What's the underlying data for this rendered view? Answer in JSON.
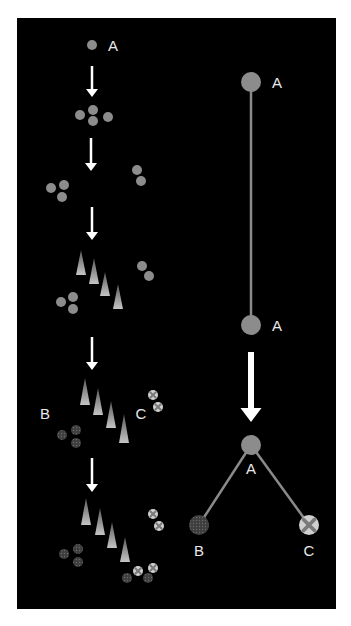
{
  "colors": {
    "background": "#000000",
    "page": "#ffffff",
    "cell_A": "#8c8c8c",
    "cell_B": "#4a4a4a",
    "cell_C": "#d0d0d0",
    "arrow": "#ffffff",
    "tree_line": "#8a8a8a",
    "label": "#e8e8e8"
  },
  "left_panel": {
    "title": "cell lineage over time",
    "labels": [
      {
        "id": "A-top",
        "text": "A",
        "x": 113,
        "y": 45
      },
      {
        "id": "B",
        "text": "B",
        "x": 45,
        "y": 413
      },
      {
        "id": "C",
        "text": "C",
        "x": 141,
        "y": 413
      }
    ],
    "arrows": [
      {
        "x": 92,
        "y1": 66,
        "y2": 97
      },
      {
        "x": 91,
        "y1": 138,
        "y2": 171
      },
      {
        "x": 92,
        "y1": 207,
        "y2": 240
      },
      {
        "x": 92,
        "y1": 337,
        "y2": 370
      },
      {
        "x": 92,
        "y1": 458,
        "y2": 492
      }
    ],
    "cells": [
      {
        "type": "A",
        "x": 92,
        "y": 45
      },
      {
        "type": "A",
        "x": 80,
        "y": 115
      },
      {
        "type": "A",
        "x": 93,
        "y": 110
      },
      {
        "type": "A",
        "x": 93,
        "y": 121
      },
      {
        "type": "A",
        "x": 108,
        "y": 117
      },
      {
        "type": "A",
        "x": 51,
        "y": 188
      },
      {
        "type": "A",
        "x": 64,
        "y": 185
      },
      {
        "type": "A",
        "x": 62,
        "y": 197
      },
      {
        "type": "A",
        "x": 137,
        "y": 170
      },
      {
        "type": "A",
        "x": 141,
        "y": 181
      },
      {
        "type": "A",
        "x": 142,
        "y": 266
      },
      {
        "type": "A",
        "x": 149,
        "y": 276
      },
      {
        "type": "A",
        "x": 61,
        "y": 302
      },
      {
        "type": "A",
        "x": 73,
        "y": 297
      },
      {
        "type": "A",
        "x": 73,
        "y": 309
      },
      {
        "type": "B",
        "x": 62,
        "y": 435
      },
      {
        "type": "B",
        "x": 76,
        "y": 430
      },
      {
        "type": "B",
        "x": 76,
        "y": 443
      },
      {
        "type": "C",
        "x": 153,
        "y": 395
      },
      {
        "type": "C",
        "x": 158,
        "y": 407
      },
      {
        "type": "C",
        "x": 153,
        "y": 514
      },
      {
        "type": "C",
        "x": 159,
        "y": 526
      },
      {
        "type": "B",
        "x": 64,
        "y": 554
      },
      {
        "type": "B",
        "x": 78,
        "y": 549
      },
      {
        "type": "B",
        "x": 78,
        "y": 562
      },
      {
        "type": "B",
        "x": 127,
        "y": 578
      },
      {
        "type": "C",
        "x": 138,
        "y": 571
      },
      {
        "type": "B",
        "x": 148,
        "y": 578
      },
      {
        "type": "C",
        "x": 153,
        "y": 568
      }
    ],
    "spikes": [
      {
        "x": 81,
        "apex": 250,
        "base": 275
      },
      {
        "x": 94,
        "apex": 258,
        "base": 284
      },
      {
        "x": 105,
        "apex": 272,
        "base": 296
      },
      {
        "x": 118,
        "apex": 284,
        "base": 309
      },
      {
        "x": 85,
        "apex": 378,
        "base": 405
      },
      {
        "x": 98,
        "apex": 388,
        "base": 415
      },
      {
        "x": 111,
        "apex": 401,
        "base": 428
      },
      {
        "x": 124,
        "apex": 414,
        "base": 443
      },
      {
        "x": 86,
        "apex": 498,
        "base": 525
      },
      {
        "x": 100,
        "apex": 508,
        "base": 535
      },
      {
        "x": 112,
        "apex": 522,
        "base": 548
      },
      {
        "x": 125,
        "apex": 537,
        "base": 562
      }
    ]
  },
  "right_panel": {
    "title": "lineage tree",
    "nodes": [
      {
        "id": "A1",
        "type": "A",
        "x": 251,
        "y": 82,
        "label": "A",
        "label_x": 277,
        "label_y": 82
      },
      {
        "id": "A2",
        "type": "A",
        "x": 251,
        "y": 325,
        "label": "A",
        "label_x": 277,
        "label_y": 325
      },
      {
        "id": "A3",
        "type": "A",
        "x": 251,
        "y": 445,
        "label": "A",
        "label_x": 251,
        "label_y": 468
      },
      {
        "id": "B",
        "type": "B",
        "x": 199,
        "y": 525,
        "label": "B",
        "label_x": 199,
        "label_y": 550
      },
      {
        "id": "C",
        "type": "C",
        "x": 309,
        "y": 525,
        "label": "C",
        "label_x": 309,
        "label_y": 550
      }
    ],
    "edges": [
      {
        "from": "A1",
        "to": "A2"
      },
      {
        "from": "A3",
        "to": "B"
      },
      {
        "from": "A3",
        "to": "C"
      }
    ],
    "arrow": {
      "x": 251,
      "y1": 352,
      "y2": 422
    }
  },
  "text": {
    "A": "A",
    "B": "B",
    "C": "C"
  }
}
